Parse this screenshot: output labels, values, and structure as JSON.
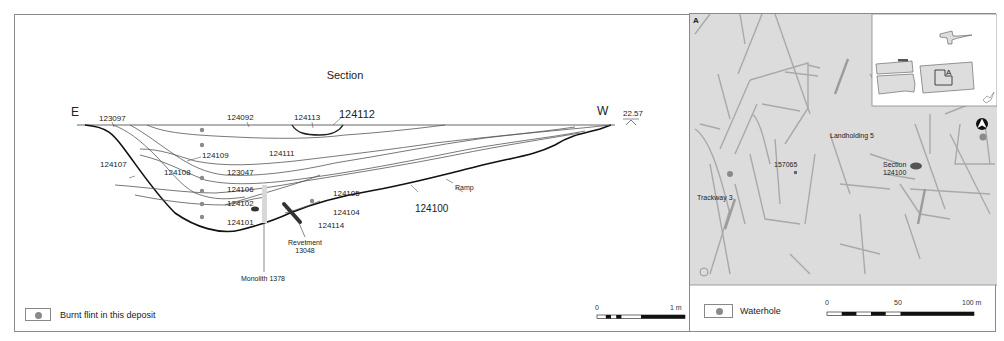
{
  "section": {
    "title": "Section",
    "east_label": "E",
    "west_label": "W",
    "datum_level": "22.57",
    "contexts": {
      "c123097": "123097",
      "c124092": "124092",
      "c124113": "124113",
      "c124112": "124112",
      "c124109": "124109",
      "c124111": "124111",
      "c124107": "124107",
      "c124108": "124108",
      "c123047": "123047",
      "c124106": "124106",
      "c124105": "124105",
      "c124102": "124102",
      "c124104": "124104",
      "c124100": "124100",
      "c124101": "124101",
      "c124114": "124114"
    },
    "ramp_label": "Ramp",
    "revetment_label": "Revetment",
    "revetment_number": "13048",
    "monolith_label": "Monolith 1378",
    "legend": {
      "burnt_flint": "Burnt flint in this deposit"
    },
    "scale": {
      "start": "0",
      "end": "1 m"
    }
  },
  "map": {
    "panel_letter": "A",
    "labels": {
      "landholding": "Landholding 5",
      "feature": "157065",
      "trackway": "Trackway 3",
      "section_line1": "Section",
      "section_line2": "124100"
    },
    "inset": {
      "area_letter": "A"
    },
    "legend": {
      "waterhole": "Waterhole"
    },
    "scale": {
      "start": "0",
      "mid": "50",
      "end": "100 m"
    },
    "colors": {
      "map_bg": "#dcdcdc",
      "feature_line": "#a8a8a8",
      "waterhole": "#8a8a8a"
    }
  }
}
